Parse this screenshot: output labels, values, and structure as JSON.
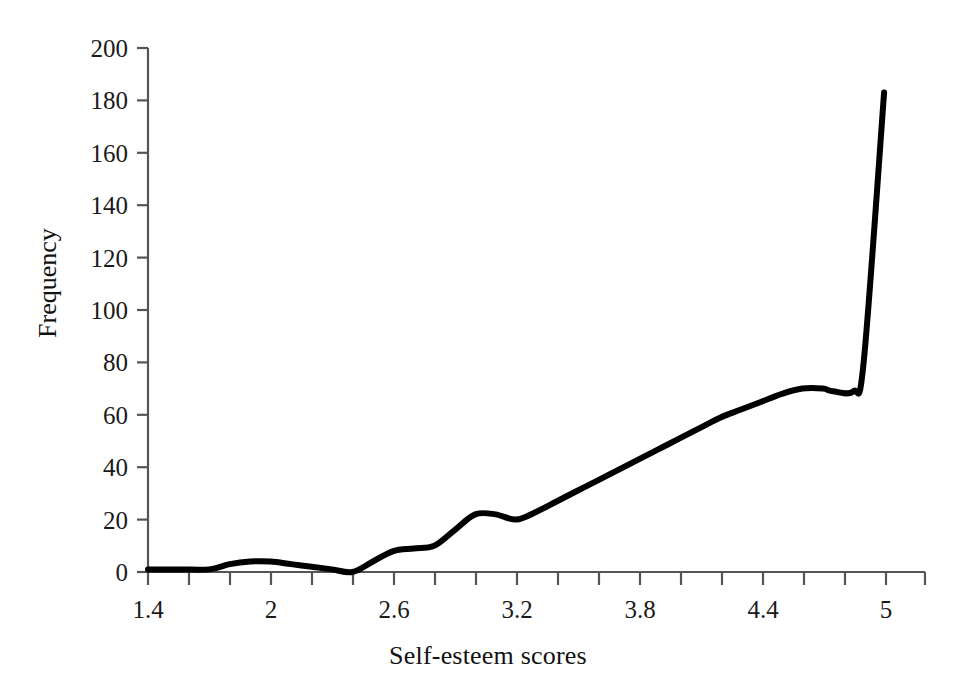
{
  "chart_data": {
    "type": "line",
    "title": "",
    "subtitle": "",
    "xlabel": "Self-esteem scores",
    "ylabel": "Frequency",
    "xlim": [
      1.4,
      5.2
    ],
    "ylim": [
      0,
      200
    ],
    "grid": false,
    "legend": null,
    "legend_position": "none",
    "line_color": "#000000",
    "line_width_px": 6,
    "background_color": "#ffffff",
    "axis_color": "#555555",
    "xticks": [
      1.4,
      1.6,
      1.8,
      2.0,
      2.2,
      2.4,
      2.6,
      2.8,
      3.0,
      3.2,
      3.4,
      3.6,
      3.8,
      4.0,
      4.2,
      4.4,
      4.6,
      4.8,
      5.0,
      5.2
    ],
    "xtick_labels": [
      "1.4",
      "",
      "",
      "2",
      "",
      "",
      "2.6",
      "",
      "",
      "3.2",
      "",
      "",
      "3.8",
      "",
      "",
      "4.4",
      "",
      "",
      "5",
      ""
    ],
    "yticks": [
      0,
      20,
      40,
      60,
      80,
      100,
      120,
      140,
      160,
      180,
      200
    ],
    "ytick_labels": [
      "0",
      "20",
      "40",
      "60",
      "80",
      "100",
      "120",
      "140",
      "160",
      "180",
      "200"
    ],
    "series": [
      {
        "name": "Self-esteem frequency",
        "x": [
          1.4,
          1.55,
          1.7,
          1.8,
          1.9,
          2.0,
          2.1,
          2.2,
          2.3,
          2.4,
          2.5,
          2.6,
          2.7,
          2.8,
          2.9,
          3.0,
          3.1,
          3.2,
          3.3,
          3.4,
          3.5,
          3.6,
          3.7,
          3.8,
          3.9,
          4.0,
          4.1,
          4.2,
          4.3,
          4.4,
          4.5,
          4.6,
          4.7,
          4.75,
          4.85,
          4.9,
          5.0
        ],
        "values": [
          1,
          1,
          1,
          3,
          4,
          4,
          3,
          2,
          1,
          0,
          4,
          8,
          9,
          10,
          16,
          22,
          22,
          20,
          23,
          27,
          31,
          35,
          39,
          43,
          47,
          51,
          55,
          59,
          62,
          65,
          68,
          70,
          70,
          69,
          69,
          80,
          183
        ]
      }
    ],
    "annotations": [
      {
        "description": "small left-tail bump",
        "x": 1.9,
        "y": 4
      },
      {
        "description": "near-zero trough",
        "x": 2.4,
        "y": 0
      },
      {
        "description": "shoulder plateau",
        "x": 2.75,
        "y": 9
      },
      {
        "description": "local peak",
        "x": 3.0,
        "y": 22
      },
      {
        "description": "shallow dip",
        "x": 3.2,
        "y": 20
      },
      {
        "description": "plateau before spike",
        "x": 4.65,
        "y": 70
      },
      {
        "description": "ceiling spike maximum",
        "x": 5.0,
        "y": 183
      }
    ]
  }
}
